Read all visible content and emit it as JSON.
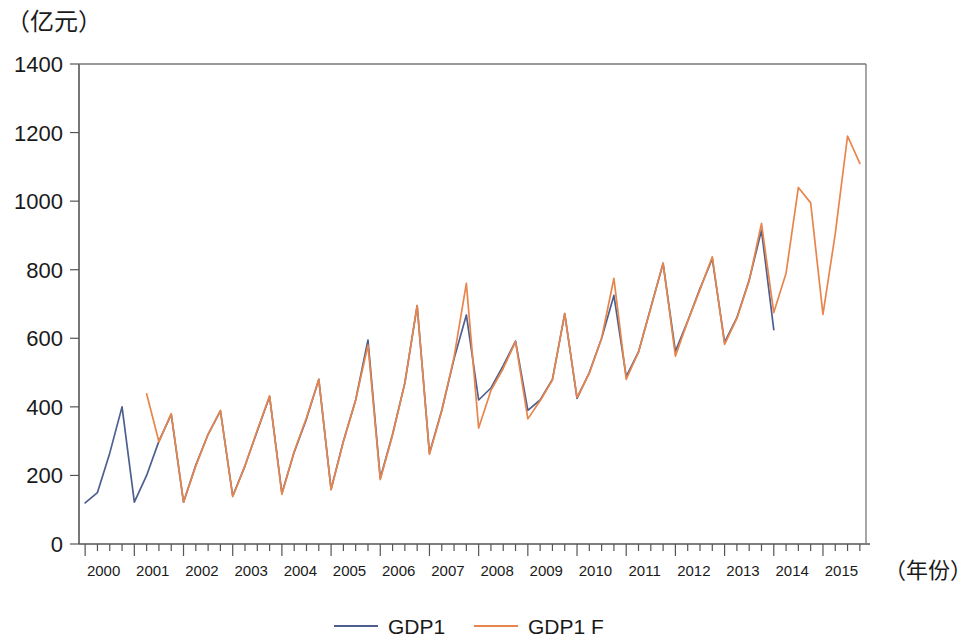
{
  "chart_data": {
    "type": "line",
    "title": "",
    "subtitle": "",
    "ylabel": "（亿元）",
    "xlabel": "（年份）",
    "ylim": [
      0,
      1400
    ],
    "ytick_values": [
      0,
      200,
      400,
      600,
      800,
      1000,
      1200,
      1400
    ],
    "ytick_labels": [
      "0",
      "200",
      "400",
      "600",
      "800",
      "1000",
      "1200",
      "1400"
    ],
    "grid": false,
    "legend_position": "bottom",
    "x_tick_interval": "quarter",
    "x_major_tick_interval": "year",
    "categories": [
      "2000Q1",
      "2000Q2",
      "2000Q3",
      "2000Q4",
      "2001Q1",
      "2001Q2",
      "2001Q3",
      "2001Q4",
      "2002Q1",
      "2002Q2",
      "2002Q3",
      "2002Q4",
      "2003Q1",
      "2003Q2",
      "2003Q3",
      "2003Q4",
      "2004Q1",
      "2004Q2",
      "2004Q3",
      "2004Q4",
      "2005Q1",
      "2005Q2",
      "2005Q3",
      "2005Q4",
      "2006Q1",
      "2006Q2",
      "2006Q3",
      "2006Q4",
      "2007Q1",
      "2007Q2",
      "2007Q3",
      "2007Q4",
      "2008Q1",
      "2008Q2",
      "2008Q3",
      "2008Q4",
      "2009Q1",
      "2009Q2",
      "2009Q3",
      "2009Q4",
      "2010Q1",
      "2010Q2",
      "2010Q3",
      "2010Q4",
      "2011Q1",
      "2011Q2",
      "2011Q3",
      "2011Q4",
      "2012Q1",
      "2012Q2",
      "2012Q3",
      "2012Q4",
      "2013Q1",
      "2013Q2",
      "2013Q3",
      "2013Q4",
      "2014Q1",
      "2014Q2",
      "2014Q3",
      "2014Q4",
      "2015Q1",
      "2015Q2",
      "2015Q3",
      "2015Q4"
    ],
    "xtick_labels": [
      "2000",
      "2001",
      "2002",
      "2003",
      "2004",
      "2005",
      "2006",
      "2007",
      "2008",
      "2009",
      "2010",
      "2011",
      "2012",
      "2013",
      "2014",
      "2015"
    ],
    "series": [
      {
        "name": "GDP1",
        "color": "#4d5f8e",
        "start_index": 0,
        "values": [
          120,
          150,
          265,
          400,
          122,
          200,
          300,
          378,
          122,
          230,
          320,
          388,
          140,
          228,
          330,
          430,
          148,
          268,
          365,
          480,
          160,
          300,
          420,
          595,
          192,
          320,
          470,
          695,
          265,
          390,
          540,
          668,
          420,
          455,
          520,
          592,
          390,
          420,
          480,
          672,
          425,
          500,
          600,
          725,
          488,
          560,
          690,
          818,
          562,
          650,
          745,
          832,
          588,
          660,
          770,
          915,
          625,
          null,
          null,
          null,
          null,
          null,
          null,
          null
        ]
      },
      {
        "name": "GDP1_F",
        "color": "#e8854c",
        "start_index": 5,
        "values": [
          null,
          null,
          null,
          null,
          null,
          438,
          298,
          380,
          122,
          228,
          320,
          390,
          138,
          228,
          332,
          432,
          145,
          270,
          368,
          480,
          158,
          298,
          420,
          580,
          188,
          318,
          470,
          695,
          262,
          388,
          545,
          760,
          338,
          448,
          512,
          590,
          365,
          418,
          478,
          672,
          428,
          498,
          600,
          775,
          480,
          560,
          688,
          820,
          548,
          650,
          742,
          838,
          582,
          658,
          768,
          935,
          675,
          790,
          1040,
          995,
          670,
          905,
          1190,
          1110
        ]
      }
    ]
  },
  "legend": {
    "items": [
      {
        "label": "GDP1",
        "color": "#4d5f8e"
      },
      {
        "label": "GDP1_F",
        "color": "#e8854c"
      }
    ]
  }
}
